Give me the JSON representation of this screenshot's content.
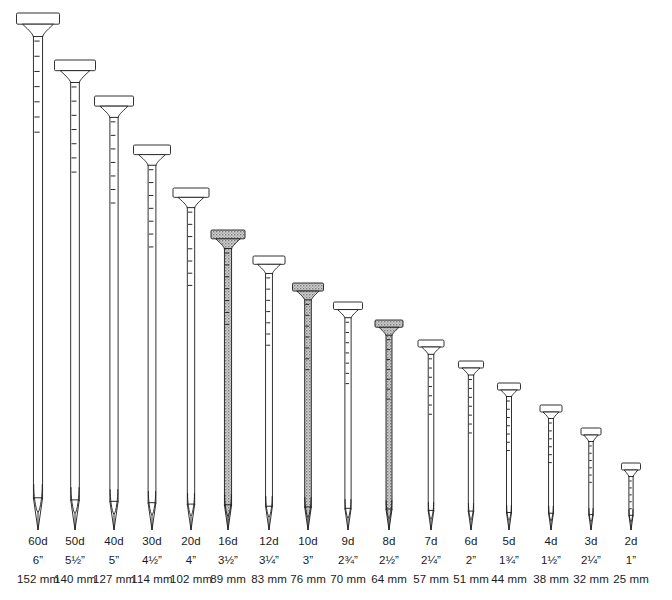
{
  "figure": {
    "baseline_y": 530,
    "stroke_color": "#1c1c1c",
    "fill_color": "#ffffff",
    "shaded_fill_color": "#b6b6b6",
    "background_color": "#ffffff"
  },
  "chart_data": {
    "type": "bar",
    "xlabel": "",
    "ylabel": "Length",
    "categories": [
      "60d",
      "50d",
      "40d",
      "30d",
      "20d",
      "16d",
      "12d",
      "10d",
      "9d",
      "8d",
      "7d",
      "6d",
      "5d",
      "4d",
      "3d",
      "2d"
    ],
    "values": [
      152,
      140,
      127,
      114,
      102,
      89,
      83,
      76,
      70,
      64,
      57,
      51,
      44,
      38,
      32,
      25
    ],
    "value_unit": "mm",
    "inches": [
      "6”",
      "5½”",
      "5”",
      "4½”",
      "4”",
      "3½”",
      "3¼”",
      "3”",
      "2¾”",
      "2½”",
      "2¼”",
      "2”",
      "1¾”",
      "1½”",
      "2¼”",
      "1”"
    ],
    "ylim": [
      0,
      152
    ],
    "grid": false,
    "legend": null,
    "highlighted": [
      "16d",
      "10d",
      "8d"
    ]
  },
  "nails": [
    {
      "id": "nail-60d",
      "penny": "60d",
      "inches": "6”",
      "mm": "152 mm",
      "cx": 38,
      "top": 13,
      "half_head": 21.5,
      "half_shaft": 4.6,
      "shaded": false,
      "ticks": 7
    },
    {
      "id": "nail-50d",
      "penny": "50d",
      "inches": "5½”",
      "mm": "140 mm",
      "cx": 75,
      "top": 60,
      "half_head": 20.5,
      "half_shaft": 4.3,
      "shaded": false,
      "ticks": 7
    },
    {
      "id": "nail-40d",
      "penny": "40d",
      "inches": "5”",
      "mm": "127 mm",
      "cx": 114,
      "top": 96,
      "half_head": 19.5,
      "half_shaft": 4.1,
      "shaded": false,
      "ticks": 7
    },
    {
      "id": "nail-30d",
      "penny": "30d",
      "inches": "4½”",
      "mm": "114 mm",
      "cx": 152,
      "top": 145,
      "half_head": 18.5,
      "half_shaft": 3.9,
      "shaded": false,
      "ticks": 7
    },
    {
      "id": "nail-20d",
      "penny": "20d",
      "inches": "4”",
      "mm": "102 mm",
      "cx": 191,
      "top": 188,
      "half_head": 18.0,
      "half_shaft": 3.7,
      "shaded": false,
      "ticks": 7
    },
    {
      "id": "nail-16d",
      "penny": "16d",
      "inches": "3½”",
      "mm": "89 mm",
      "cx": 228,
      "top": 230,
      "half_head": 17.0,
      "half_shaft": 3.6,
      "shaded": true,
      "ticks": 7
    },
    {
      "id": "nail-12d",
      "penny": "12d",
      "inches": "3¼”",
      "mm": "83 mm",
      "cx": 269,
      "top": 256,
      "half_head": 16.0,
      "half_shaft": 3.4,
      "shaded": false,
      "ticks": 7
    },
    {
      "id": "nail-10d",
      "penny": "10d",
      "inches": "3”",
      "mm": "76 mm",
      "cx": 308,
      "top": 283,
      "half_head": 15.5,
      "half_shaft": 3.3,
      "shaded": true,
      "ticks": 7
    },
    {
      "id": "nail-9d",
      "penny": "9d",
      "inches": "2¾”",
      "mm": "70 mm",
      "cx": 348,
      "top": 302,
      "half_head": 14.5,
      "half_shaft": 3.1,
      "shaded": false,
      "ticks": 7
    },
    {
      "id": "nail-8d",
      "penny": "8d",
      "inches": "2½”",
      "mm": "64 mm",
      "cx": 389,
      "top": 320,
      "half_head": 14.0,
      "half_shaft": 3.0,
      "shaded": true,
      "ticks": 7
    },
    {
      "id": "nail-7d",
      "penny": "7d",
      "inches": "2¼”",
      "mm": "57 mm",
      "cx": 431,
      "top": 340,
      "half_head": 13.0,
      "half_shaft": 2.8,
      "shaded": false,
      "ticks": 7
    },
    {
      "id": "nail-6d",
      "penny": "6d",
      "inches": "2”",
      "mm": "51 mm",
      "cx": 471,
      "top": 361,
      "half_head": 12.5,
      "half_shaft": 2.7,
      "shaded": false,
      "ticks": 7
    },
    {
      "id": "nail-5d",
      "penny": "5d",
      "inches": "1¾”",
      "mm": "44 mm",
      "cx": 509,
      "top": 383,
      "half_head": 11.5,
      "half_shaft": 2.5,
      "shaded": false,
      "ticks": 7
    },
    {
      "id": "nail-4d",
      "penny": "4d",
      "inches": "1½”",
      "mm": "38 mm",
      "cx": 551,
      "top": 405,
      "half_head": 11.0,
      "half_shaft": 2.4,
      "shaded": false,
      "ticks": 6
    },
    {
      "id": "nail-3d",
      "penny": "3d",
      "inches": "2¼”",
      "mm": "32 mm",
      "cx": 591,
      "top": 428,
      "half_head": 10.0,
      "half_shaft": 2.2,
      "shaded": false,
      "ticks": 6
    },
    {
      "id": "nail-2d",
      "penny": "2d",
      "inches": "1”",
      "mm": "25 mm",
      "cx": 631,
      "top": 463,
      "half_head": 9.5,
      "half_shaft": 2.1,
      "shaded": false,
      "ticks": 6
    }
  ]
}
